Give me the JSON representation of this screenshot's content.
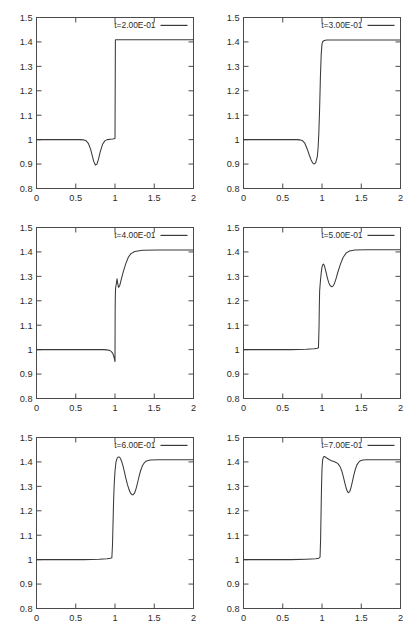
{
  "figure": {
    "title": "",
    "layout": {
      "rows": 3,
      "cols": 2,
      "panel_width": 207,
      "panel_height": 210
    },
    "line_color": "#3a3a3a",
    "frame_color": "#4a4a4a",
    "background": "#ffffff"
  },
  "axes": {
    "x": {
      "min": 0,
      "max": 2,
      "ticks": [
        0,
        0.5,
        1,
        1.5,
        2
      ],
      "ticklabels": [
        "0",
        "0.5",
        "1",
        "1.5",
        "2"
      ],
      "label": ""
    },
    "y": {
      "min": 0.8,
      "max": 1.5,
      "ticks": [
        0.8,
        0.9,
        1.0,
        1.1,
        1.2,
        1.3,
        1.4,
        1.5
      ],
      "ticklabels": [
        "0.8",
        "0.9",
        "1",
        "1.1",
        "1.2",
        "1.3",
        "1.4",
        "1.5"
      ],
      "label": ""
    }
  },
  "chart_data": [
    {
      "type": "line",
      "panel_index": 0,
      "title": "",
      "legend": "t=2.00E-01",
      "legend_position": "top-right",
      "xlabel": "",
      "ylabel": "",
      "xlim": [
        0,
        2
      ],
      "ylim": [
        0.8,
        1.5
      ],
      "grid": false,
      "series": [
        {
          "name": "t=2.00E-01",
          "x": [
            0.0,
            0.1,
            0.2,
            0.3,
            0.4,
            0.5,
            0.55,
            0.6,
            0.63,
            0.66,
            0.69,
            0.71,
            0.73,
            0.75,
            0.77,
            0.79,
            0.81,
            0.84,
            0.87,
            0.9,
            0.94,
            0.97,
            0.99,
            0.995,
            1.0,
            1.005,
            1.01,
            1.05,
            1.2,
            1.5,
            1.8,
            2.0
          ],
          "y": [
            1.0,
            1.0,
            1.0,
            1.0,
            1.0,
            1.0,
            1.0,
            0.999,
            0.996,
            0.985,
            0.96,
            0.935,
            0.91,
            0.896,
            0.9,
            0.92,
            0.948,
            0.98,
            0.995,
            1.0,
            1.002,
            1.003,
            1.004,
            1.004,
            1.005,
            1.408,
            1.409,
            1.409,
            1.409,
            1.409,
            1.409,
            1.409
          ]
        }
      ]
    },
    {
      "type": "line",
      "panel_index": 1,
      "title": "",
      "legend": "t=3.00E-01",
      "legend_position": "top-right",
      "xlabel": "",
      "ylabel": "",
      "xlim": [
        0,
        2
      ],
      "ylim": [
        0.8,
        1.5
      ],
      "grid": false,
      "series": [
        {
          "name": "t=3.00E-01",
          "x": [
            0.0,
            0.15,
            0.3,
            0.45,
            0.6,
            0.68,
            0.72,
            0.75,
            0.78,
            0.81,
            0.84,
            0.86,
            0.88,
            0.9,
            0.92,
            0.94,
            0.95,
            0.96,
            0.97,
            0.98,
            0.99,
            1.0,
            1.01,
            1.03,
            1.06,
            1.1,
            1.2,
            1.4,
            1.7,
            2.0
          ],
          "y": [
            1.0,
            1.0,
            1.0,
            1.0,
            1.0,
            1.0,
            0.999,
            0.996,
            0.986,
            0.963,
            0.935,
            0.918,
            0.905,
            0.9,
            0.906,
            0.93,
            0.965,
            1.03,
            1.13,
            1.26,
            1.35,
            1.392,
            1.402,
            1.406,
            1.408,
            1.408,
            1.408,
            1.408,
            1.408,
            1.408
          ]
        }
      ]
    },
    {
      "type": "line",
      "panel_index": 2,
      "title": "",
      "legend": "t=4.00E-01",
      "legend_position": "top-right",
      "xlabel": "",
      "ylabel": "",
      "xlim": [
        0,
        2
      ],
      "ylim": [
        0.8,
        1.5
      ],
      "grid": false,
      "series": [
        {
          "name": "t=4.00E-01",
          "x": [
            0.0,
            0.2,
            0.4,
            0.6,
            0.75,
            0.85,
            0.9,
            0.93,
            0.95,
            0.965,
            0.975,
            0.982,
            0.988,
            0.993,
            0.997,
            0.999,
            1.0,
            1.001,
            1.002,
            1.004,
            1.006,
            1.008,
            1.01,
            1.013,
            1.016,
            1.02,
            1.026,
            1.034,
            1.045,
            1.06,
            1.08,
            1.105,
            1.135,
            1.17,
            1.2,
            1.25,
            1.35,
            1.55,
            1.8,
            2.0
          ],
          "y": [
            1.0,
            1.0,
            1.0,
            1.0,
            1.0,
            1.0,
            0.999,
            0.997,
            0.993,
            0.988,
            0.982,
            0.975,
            0.968,
            0.961,
            0.955,
            0.952,
            0.951,
            1.06,
            1.16,
            1.215,
            1.24,
            1.252,
            1.258,
            1.262,
            1.268,
            1.278,
            1.29,
            1.272,
            1.255,
            1.262,
            1.288,
            1.318,
            1.35,
            1.378,
            1.392,
            1.402,
            1.407,
            1.408,
            1.408,
            1.408
          ]
        }
      ]
    },
    {
      "type": "line",
      "panel_index": 3,
      "title": "",
      "legend": "t=5.00E-01",
      "legend_position": "top-right",
      "xlabel": "",
      "ylabel": "",
      "xlim": [
        0,
        2
      ],
      "ylim": [
        0.8,
        1.5
      ],
      "grid": false,
      "series": [
        {
          "name": "t=5.00E-01",
          "x": [
            0.0,
            0.2,
            0.4,
            0.6,
            0.8,
            0.9,
            0.94,
            0.955,
            0.962,
            0.966,
            0.97,
            0.975,
            0.982,
            0.99,
            1.0,
            1.01,
            1.02,
            1.03,
            1.042,
            1.055,
            1.07,
            1.085,
            1.1,
            1.115,
            1.13,
            1.145,
            1.16,
            1.18,
            1.205,
            1.235,
            1.27,
            1.31,
            1.35,
            1.42,
            1.55,
            1.75,
            2.0
          ],
          "y": [
            1.0,
            1.0,
            1.0,
            1.0,
            1.002,
            1.004,
            1.006,
            1.008,
            1.09,
            1.18,
            1.24,
            1.262,
            1.288,
            1.315,
            1.338,
            1.348,
            1.35,
            1.344,
            1.33,
            1.312,
            1.292,
            1.275,
            1.264,
            1.259,
            1.258,
            1.262,
            1.272,
            1.292,
            1.32,
            1.35,
            1.378,
            1.396,
            1.404,
            1.408,
            1.409,
            1.409,
            1.409
          ]
        }
      ]
    },
    {
      "type": "line",
      "panel_index": 4,
      "title": "",
      "legend": "t=6.00E-01",
      "legend_position": "top-right",
      "xlabel": "",
      "ylabel": "",
      "xlim": [
        0,
        2
      ],
      "ylim": [
        0.8,
        1.5
      ],
      "grid": false,
      "series": [
        {
          "name": "t=6.00E-01",
          "x": [
            0.0,
            0.2,
            0.4,
            0.6,
            0.8,
            0.9,
            0.94,
            0.96,
            0.968,
            0.975,
            0.982,
            0.99,
            1.0,
            1.012,
            1.025,
            1.04,
            1.055,
            1.07,
            1.085,
            1.1,
            1.118,
            1.138,
            1.158,
            1.178,
            1.198,
            1.215,
            1.232,
            1.248,
            1.262,
            1.278,
            1.295,
            1.312,
            1.33,
            1.35,
            1.372,
            1.4,
            1.45,
            1.55,
            1.75,
            2.0
          ],
          "y": [
            1.0,
            1.0,
            1.0,
            1.0,
            1.002,
            1.004,
            1.006,
            1.008,
            1.06,
            1.15,
            1.24,
            1.31,
            1.362,
            1.398,
            1.414,
            1.42,
            1.42,
            1.414,
            1.402,
            1.386,
            1.362,
            1.334,
            1.308,
            1.288,
            1.272,
            1.266,
            1.266,
            1.272,
            1.284,
            1.302,
            1.325,
            1.348,
            1.368,
            1.385,
            1.396,
            1.404,
            1.408,
            1.409,
            1.409,
            1.409
          ]
        }
      ]
    },
    {
      "type": "line",
      "panel_index": 5,
      "title": "",
      "legend": "t=7.00E-01",
      "legend_position": "top-right",
      "xlabel": "",
      "ylabel": "",
      "xlim": [
        0,
        2
      ],
      "ylim": [
        0.8,
        1.5
      ],
      "grid": false,
      "series": [
        {
          "name": "t=7.00E-01",
          "x": [
            0.0,
            0.2,
            0.4,
            0.6,
            0.8,
            0.92,
            0.96,
            0.975,
            0.982,
            0.988,
            0.994,
            1.0,
            1.008,
            1.018,
            1.03,
            1.045,
            1.065,
            1.09,
            1.12,
            1.15,
            1.18,
            1.205,
            1.228,
            1.25,
            1.27,
            1.29,
            1.31,
            1.325,
            1.34,
            1.355,
            1.37,
            1.388,
            1.405,
            1.425,
            1.445,
            1.465,
            1.49,
            1.52,
            1.57,
            1.65,
            1.8,
            2.0
          ],
          "y": [
            1.0,
            1.0,
            1.0,
            1.0,
            1.002,
            1.004,
            1.006,
            1.01,
            1.08,
            1.19,
            1.3,
            1.372,
            1.408,
            1.42,
            1.422,
            1.42,
            1.415,
            1.41,
            1.405,
            1.402,
            1.398,
            1.392,
            1.382,
            1.365,
            1.342,
            1.315,
            1.29,
            1.278,
            1.274,
            1.28,
            1.296,
            1.32,
            1.346,
            1.37,
            1.388,
            1.398,
            1.405,
            1.408,
            1.409,
            1.409,
            1.409,
            1.409
          ]
        }
      ]
    }
  ]
}
